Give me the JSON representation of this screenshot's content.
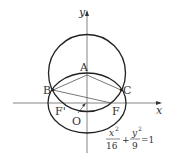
{
  "diagram": {
    "axes": {
      "x_label": "x",
      "y_label": "y"
    },
    "points": {
      "A": "A",
      "B": "B",
      "C": "C",
      "F": "F",
      "F_prime": "F'",
      "O": "O"
    },
    "equation": {
      "x_num": "x",
      "x_exp": "2",
      "x_den": "16",
      "plus": "+",
      "y_num": "y",
      "y_exp": "2",
      "y_den": "9",
      "rhs": "=1"
    },
    "colors": {
      "stroke": "#222222",
      "thin": "#555555"
    }
  }
}
